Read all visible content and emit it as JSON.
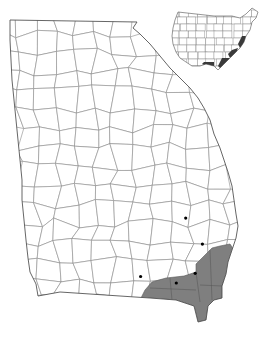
{
  "map": {
    "subject": "Georgia county distribution map",
    "region": "Georgia, USA",
    "inset_region": "Contiguous United States",
    "colors": {
      "background": "#ffffff",
      "county_border": "#8a8a8a",
      "range_fill": "#7f7f7f",
      "occurrence_dot": "#000000"
    },
    "legend": {
      "shaded": "Range (counties)",
      "dot": "Documented occurrence"
    },
    "occurrences": [
      {
        "label": "occurrence-1",
        "lon": -81.9,
        "lat": 31.95
      },
      {
        "label": "occurrence-2",
        "lon": -81.55,
        "lat": 31.55
      },
      {
        "label": "occurrence-3",
        "lon": -81.7,
        "lat": 31.1
      },
      {
        "label": "occurrence-4",
        "lon": -82.85,
        "lat": 31.05
      },
      {
        "label": "occurrence-5",
        "lon": -82.1,
        "lat": 30.95
      }
    ],
    "inset_range_states": [
      "DE",
      "MD",
      "VA",
      "NC",
      "SC",
      "GA",
      "FL",
      "AL",
      "MS",
      "LA"
    ]
  }
}
